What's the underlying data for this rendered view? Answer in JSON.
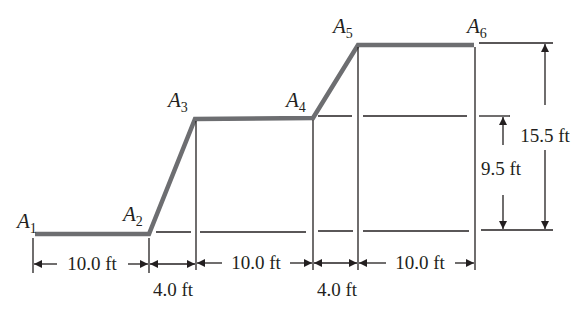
{
  "diagram": {
    "type": "stepped ramp profile with dimension lines",
    "colors": {
      "profile": "#6d6e71",
      "lines": "#231f20",
      "background": "#ffffff"
    },
    "points": [
      {
        "letter": "A",
        "sub": "1"
      },
      {
        "letter": "A",
        "sub": "2"
      },
      {
        "letter": "A",
        "sub": "3"
      },
      {
        "letter": "A",
        "sub": "4"
      },
      {
        "letter": "A",
        "sub": "5"
      },
      {
        "letter": "A",
        "sub": "6"
      }
    ],
    "horizontal_dimensions": [
      {
        "label": "10.0 ft",
        "from": "A1",
        "to": "A2"
      },
      {
        "label": "4.0 ft",
        "from": "A2",
        "to": "A3"
      },
      {
        "label": "10.0 ft",
        "from": "A3",
        "to": "A4"
      },
      {
        "label": "4.0 ft",
        "from": "A4",
        "to": "A5"
      },
      {
        "label": "10.0 ft",
        "from": "A5",
        "to": "A6"
      }
    ],
    "vertical_dimensions": [
      {
        "label": "9.5 ft",
        "from": "ground",
        "to": "A3-A4 level"
      },
      {
        "label": "15.5 ft",
        "from": "ground",
        "to": "A5-A6 level"
      }
    ]
  }
}
